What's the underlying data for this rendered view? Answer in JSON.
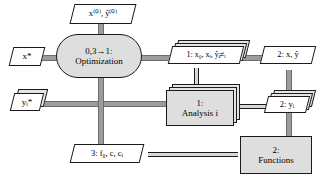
{
  "diagram": {
    "colors": {
      "process_line": "#1a1a1a",
      "data_line": "#9c9c9c",
      "component_fill": "#dedede",
      "data_fill": "#ffffff",
      "stack_shadow": "#e4e4e4",
      "background": "#ffffff"
    }
  },
  "nodes": {
    "initial_values": {
      "shape": "parallelogram",
      "text": "x⁽⁰⁾, ŷ⁽⁰⁾",
      "role": "input-data"
    },
    "x_optimal": {
      "shape": "parallelogram",
      "text": "x*",
      "role": "output-data"
    },
    "optimizer": {
      "shape": "rounded-rectangle",
      "line1": "0,3→1:",
      "line2": "Optimization",
      "role": "driver"
    },
    "opt_output_data": {
      "shape": "parallelogram-stacked",
      "text": "1: x₀, xᵢ, ŷⱼ≠ᵢ",
      "role": "data"
    },
    "x_yhat_data": {
      "shape": "parallelogram",
      "text": "2: x, ŷ",
      "role": "data"
    },
    "y_targets": {
      "shape": "parallelogram-stacked",
      "text": "yᵢ*",
      "role": "output-data"
    },
    "analysis": {
      "shape": "rectangle-stacked",
      "line1": "1:",
      "line2": "Analysis i",
      "role": "discipline"
    },
    "analysis_output_data": {
      "shape": "parallelogram-stacked",
      "text": "2: yᵢ",
      "role": "data"
    },
    "objective_data": {
      "shape": "parallelogram",
      "text": "3: f₀, c, cᵢ",
      "role": "data"
    },
    "functions": {
      "shape": "rectangle",
      "line1": "2:",
      "line2": "Functions",
      "role": "component"
    }
  }
}
